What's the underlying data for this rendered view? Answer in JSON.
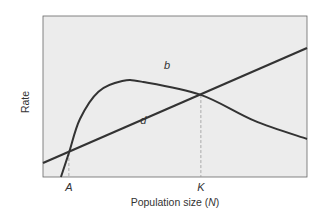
{
  "chart_data": {
    "type": "line",
    "title": "",
    "xlabel": "Population size (N)",
    "xlabel_parts": {
      "prefix": "Population size (",
      "var": "N",
      "suffix": ")"
    },
    "ylabel": "Rate",
    "grid": false,
    "legend": "none (curves labeled inline)",
    "xlim": [
      0,
      1
    ],
    "ylim": [
      0,
      1
    ],
    "x_ticks": [
      {
        "label": "A",
        "x": 0.098,
        "dashed_guide": true
      },
      {
        "label": "K",
        "x": 0.598,
        "dashed_guide": true
      }
    ],
    "series": [
      {
        "name": "b",
        "label": "b",
        "description": "birth rate — hump-shaped curve rising steeply, peaking, then declining",
        "points": [
          [
            0.068,
            0.0
          ],
          [
            0.098,
            0.149
          ],
          [
            0.14,
            0.36
          ],
          [
            0.21,
            0.53
          ],
          [
            0.3,
            0.596
          ],
          [
            0.38,
            0.59
          ],
          [
            0.598,
            0.51
          ],
          [
            0.8,
            0.35
          ],
          [
            1.0,
            0.236
          ]
        ]
      },
      {
        "name": "d",
        "label": "d",
        "description": "death rate — straight line increasing with N",
        "points": [
          [
            0.0,
            0.087
          ],
          [
            0.098,
            0.149
          ],
          [
            0.598,
            0.509
          ],
          [
            1.0,
            0.801
          ]
        ]
      }
    ],
    "annotations": [
      {
        "text": "b",
        "x": 0.47,
        "y": 0.67
      },
      {
        "text": "d",
        "x": 0.38,
        "y": 0.33
      },
      {
        "text": "A",
        "note": "lower intersection of b and d"
      },
      {
        "text": "K",
        "note": "upper intersection of b and d (carrying capacity)"
      }
    ],
    "colors": {
      "plot_background": "#ececec",
      "lines": "#333333",
      "guides": "#999999",
      "frame": "#555555"
    }
  }
}
